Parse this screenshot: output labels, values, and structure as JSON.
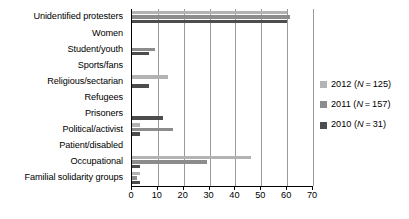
{
  "chart_data": {
    "type": "bar",
    "orientation": "horizontal",
    "title": "",
    "xlabel": "",
    "ylabel": "",
    "xlim": [
      0,
      70
    ],
    "xticks": [
      0,
      10,
      20,
      30,
      40,
      50,
      60,
      70
    ],
    "grid": true,
    "legend_position": "right",
    "categories": [
      "Unidentified protesters",
      "Women",
      "Student/youth",
      "Sports/fans",
      "Religious/sectarian",
      "Refugees",
      "Prisoners",
      "Political/activist",
      "Patient/disabled",
      "Occupational",
      "Familial solidarity groups"
    ],
    "series": [
      {
        "name": "2012",
        "legend_label": "2012 (N = 125)",
        "n": 125,
        "color": "#b3b3b3",
        "values": [
          60,
          0,
          0,
          0,
          14,
          0,
          0,
          3,
          0,
          46,
          3
        ]
      },
      {
        "name": "2011",
        "legend_label": "2011 (N = 157)",
        "n": 157,
        "color": "#8c8c8c",
        "values": [
          61,
          0,
          9,
          0,
          0,
          0,
          0,
          16,
          0,
          29,
          2
        ]
      },
      {
        "name": "2010",
        "legend_label": "2010 (N = 31)",
        "n": 31,
        "color": "#4d4d4d",
        "values": [
          60,
          0,
          6.5,
          0,
          6.5,
          0,
          12,
          3,
          0,
          3,
          3
        ]
      }
    ]
  },
  "legend": {
    "entries": [
      {
        "year": "2012",
        "n_text": "(N = 125)",
        "label": "2012 (N = 125)",
        "color": "#b3b3b3"
      },
      {
        "year": "2011",
        "n_text": "(N = 157)",
        "label": "2011 (N = 157)",
        "color": "#8c8c8c"
      },
      {
        "year": "2010",
        "n_text": "(N = 31)",
        "label": "2010 (N = 31)",
        "color": "#4d4d4d"
      }
    ]
  },
  "axis": {
    "tick_labels": [
      "0",
      "10",
      "20",
      "30",
      "40",
      "50",
      "60",
      "70"
    ]
  },
  "colors": {
    "series_2012": "#b3b3b3",
    "series_2011": "#8c8c8c",
    "series_2010": "#4d4d4d",
    "gridline": "#9a9a9a",
    "axis": "#000000",
    "background": "#ffffff"
  }
}
